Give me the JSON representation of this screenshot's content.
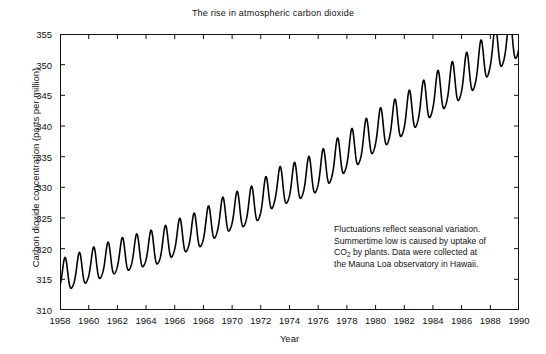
{
  "chart_data": {
    "type": "line",
    "title": "The rise in atmospheric carbon dioxide",
    "xlabel": "Year",
    "ylabel": "Carbon dioxide concentration (parts per million)",
    "xlim": [
      1958,
      1990
    ],
    "ylim": [
      310,
      355
    ],
    "grid": false,
    "legend": null,
    "xticks": [
      1958,
      1960,
      1962,
      1964,
      1966,
      1968,
      1970,
      1972,
      1974,
      1976,
      1978,
      1980,
      1982,
      1984,
      1986,
      1988,
      1990
    ],
    "yticks": [
      310,
      315,
      320,
      325,
      330,
      335,
      340,
      345,
      350,
      355
    ],
    "series": [
      {
        "name": "Mauna Loa CO2 (monthly)",
        "description": "Keeling curve: rising trend with seasonal sawtooth oscillation",
        "trend_start_ppm": 315.3,
        "trend_end_ppm": 352.0,
        "seasonal_amplitude_start_ppm": 5.2,
        "seasonal_amplitude_end_ppm": 7.0,
        "seasonal_peak_month": 5,
        "annual_means": [
          {
            "year": 1958,
            "value": 315.3
          },
          {
            "year": 1959,
            "value": 315.98
          },
          {
            "year": 1960,
            "value": 316.91
          },
          {
            "year": 1961,
            "value": 317.64
          },
          {
            "year": 1962,
            "value": 318.45
          },
          {
            "year": 1963,
            "value": 318.99
          },
          {
            "year": 1964,
            "value": 319.62
          },
          {
            "year": 1965,
            "value": 320.04
          },
          {
            "year": 1966,
            "value": 321.38
          },
          {
            "year": 1967,
            "value": 322.16
          },
          {
            "year": 1968,
            "value": 323.04
          },
          {
            "year": 1969,
            "value": 324.62
          },
          {
            "year": 1970,
            "value": 325.68
          },
          {
            "year": 1971,
            "value": 326.32
          },
          {
            "year": 1972,
            "value": 327.45
          },
          {
            "year": 1973,
            "value": 329.68
          },
          {
            "year": 1974,
            "value": 330.18
          },
          {
            "year": 1975,
            "value": 331.11
          },
          {
            "year": 1976,
            "value": 332.04
          },
          {
            "year": 1977,
            "value": 333.83
          },
          {
            "year": 1978,
            "value": 335.4
          },
          {
            "year": 1979,
            "value": 336.84
          },
          {
            "year": 1980,
            "value": 338.75
          },
          {
            "year": 1981,
            "value": 340.11
          },
          {
            "year": 1982,
            "value": 341.45
          },
          {
            "year": 1983,
            "value": 343.05
          },
          {
            "year": 1984,
            "value": 344.65
          },
          {
            "year": 1985,
            "value": 346.12
          },
          {
            "year": 1986,
            "value": 347.42
          },
          {
            "year": 1987,
            "value": 349.19
          },
          {
            "year": 1988,
            "value": 351.57
          },
          {
            "year": 1989,
            "value": 353.12
          },
          {
            "year": 1990,
            "value": 354.39
          }
        ],
        "color": "#000000",
        "line_width": 1.6
      }
    ],
    "annotation": {
      "line1": "Fluctuations reflect seasonal variation.",
      "line2": "Summertime low is caused by uptake of",
      "line3_pre": "CO",
      "line3_sub": "2",
      "line3_post": " by plants. Data were collected at",
      "line4": "the Mauna Loa observatory in Hawaii."
    }
  }
}
